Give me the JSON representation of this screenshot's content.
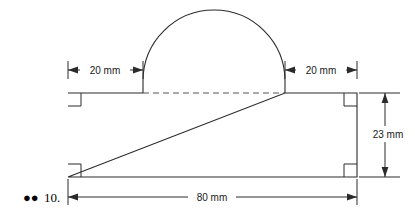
{
  "figure": {
    "item_number": "10.",
    "bullets": "●●",
    "ink_color": "#2b2b2b",
    "background_color": "#ffffff",
    "dashed_color": "#555555"
  },
  "dimensions": {
    "left_offset": {
      "label": "20 mm",
      "value": 20,
      "unit": "mm",
      "orientation": "horizontal",
      "position": "top-left"
    },
    "right_offset": {
      "label": "20 mm",
      "value": 20,
      "unit": "mm",
      "orientation": "horizontal",
      "position": "top-right"
    },
    "height": {
      "label": "23 mm",
      "value": 23,
      "unit": "mm",
      "orientation": "vertical",
      "position": "right"
    },
    "width": {
      "label": "80 mm",
      "value": 80,
      "unit": "mm",
      "orientation": "horizontal",
      "position": "bottom"
    }
  },
  "shape": {
    "type": "rectangle-with-semicircle",
    "corner_markers": [
      "top-left-right-angle",
      "top-right-right-angle",
      "bottom-left-right-angle",
      "bottom-right-right-angle"
    ],
    "corner_marker_count": 4,
    "chord_style": "dashed",
    "arc_style": "solid"
  }
}
